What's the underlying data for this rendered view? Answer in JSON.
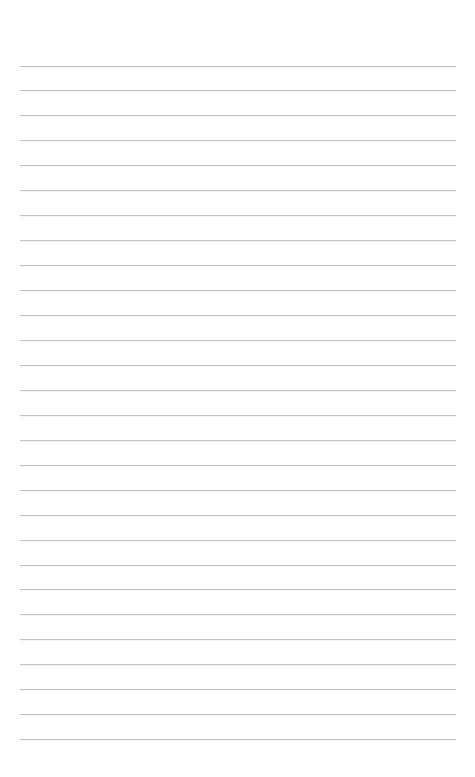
{
  "page": {
    "type": "lined-paper",
    "background_color": "#ffffff",
    "line_color": "#c4c4c4",
    "line_count": 28,
    "first_line_y": 65.5,
    "line_spacing": 24.95,
    "line_left_x": 20,
    "line_right_x": 456
  }
}
